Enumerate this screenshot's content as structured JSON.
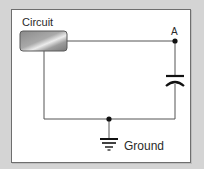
{
  "diagram": {
    "type": "circuit-schematic",
    "labels": {
      "circuit": "Circuit",
      "node_a": "A",
      "ground": "Ground"
    },
    "components": [
      {
        "name": "circuit-block",
        "kind": "block",
        "label": "Circuit"
      },
      {
        "name": "capacitor",
        "kind": "capacitor",
        "polarized_curve": true
      },
      {
        "name": "ground",
        "kind": "ground-symbol",
        "label": "Ground"
      }
    ],
    "nodes": [
      {
        "name": "node-a",
        "label": "A"
      },
      {
        "name": "ground-node",
        "label": ""
      }
    ],
    "colors": {
      "background": "#d4d4d4",
      "frame_fill": "#ffffff",
      "frame_border": "#6e6e6e",
      "wire": "#555555",
      "node": "#111111",
      "block_dark": "#7a7a7a",
      "block_light": "#e8e8e8"
    }
  }
}
